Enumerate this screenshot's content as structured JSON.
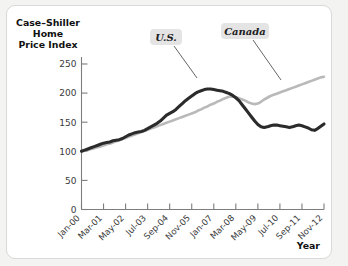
{
  "figure": {
    "y_axis_title_lines": [
      "Case–Shiller",
      "Home",
      "Price Index"
    ],
    "x_axis_title": "Year",
    "series_labels": {
      "us": "U.S.",
      "canada": "Canada"
    },
    "colors": {
      "us_line": "#2b2b2b",
      "canada_line": "#b9b9b9",
      "axis": "#7d7d7d",
      "callout_bg": "#e4e4e4",
      "card_bg": "#ffffff",
      "card_border": "#d9d9d7",
      "page_bg": "#f3f3f1"
    }
  },
  "chart_data": {
    "type": "line",
    "title": "",
    "subtitle": "",
    "xlabel": "Year",
    "ylabel": "Case–Shiller Home Price Index",
    "ylim": [
      0,
      262
    ],
    "yticks": [
      0,
      50,
      100,
      150,
      200,
      250
    ],
    "ytick_labels": [
      "0",
      "50",
      "100",
      "150",
      "200",
      "250"
    ],
    "xtick_labels": [
      "Jan-00",
      "Mar-01",
      "May-02",
      "Jul-03",
      "Sep-04",
      "Nov-05",
      "Jan-07",
      "Mar-08",
      "May-09",
      "Jul-10",
      "Sep-11",
      "Nov-12"
    ],
    "grid": false,
    "legend": "annotated-callouts",
    "annotations": [
      {
        "text": "U.S.",
        "points_to_series": "U.S."
      },
      {
        "text": "Canada",
        "points_to_series": "Canada"
      }
    ],
    "x": [
      0,
      1,
      2,
      3,
      4,
      5,
      6,
      7,
      8,
      9,
      10,
      11,
      12,
      13,
      14,
      15,
      16,
      17,
      18,
      19,
      20,
      21,
      22,
      23,
      24,
      25,
      26,
      27,
      28,
      29,
      30,
      31,
      32,
      33,
      34,
      35,
      36,
      37,
      38,
      39,
      40,
      41,
      42,
      43,
      44,
      45,
      46,
      47,
      48,
      49,
      50,
      51,
      52,
      53,
      54,
      55,
      56,
      57,
      58,
      59,
      60,
      61,
      62,
      63,
      64,
      65,
      66,
      67,
      68,
      69,
      70,
      71,
      72,
      73,
      74,
      75,
      76,
      77
    ],
    "x_dates": [
      "Jan-00",
      "Mar-00",
      "May-00",
      "Jul-00",
      "Sep-00",
      "Nov-00",
      "Jan-01",
      "Mar-01",
      "May-01",
      "Jul-01",
      "Sep-01",
      "Nov-01",
      "Jan-02",
      "Mar-02",
      "May-02",
      "Jul-02",
      "Sep-02",
      "Nov-02",
      "Jan-03",
      "Mar-03",
      "May-03",
      "Jul-03",
      "Sep-03",
      "Nov-03",
      "Jan-04",
      "Mar-04",
      "May-04",
      "Jul-04",
      "Sep-04",
      "Nov-04",
      "Jan-05",
      "Mar-05",
      "May-05",
      "Jul-05",
      "Sep-05",
      "Nov-05",
      "Jan-06",
      "Mar-06",
      "May-06",
      "Jul-06",
      "Sep-06",
      "Nov-06",
      "Jan-07",
      "Mar-07",
      "May-07",
      "Jul-07",
      "Sep-07",
      "Nov-07",
      "Jan-08",
      "Mar-08",
      "May-08",
      "Jul-08",
      "Sep-08",
      "Nov-08",
      "Jan-09",
      "Mar-09",
      "May-09",
      "Jul-09",
      "Sep-09",
      "Nov-09",
      "Jan-10",
      "Mar-10",
      "May-10",
      "Jul-10",
      "Sep-10",
      "Nov-10",
      "Jan-11",
      "Mar-11",
      "May-11",
      "Jul-11",
      "Sep-11",
      "Nov-11",
      "Jan-12",
      "Mar-12",
      "May-12",
      "Jul-12",
      "Sep-12",
      "Nov-12"
    ],
    "series": [
      {
        "name": "U.S.",
        "color": "#2b2b2b",
        "values": [
          100,
          102,
          104,
          106,
          108,
          110,
          112,
          114,
          115,
          116,
          118,
          119,
          120,
          122,
          125,
          128,
          130,
          132,
          133,
          134,
          136,
          139,
          142,
          145,
          148,
          152,
          157,
          162,
          165,
          168,
          172,
          177,
          182,
          187,
          191,
          195,
          199,
          202,
          204,
          206,
          207,
          207,
          206,
          205,
          204,
          203,
          201,
          199,
          196,
          192,
          187,
          180,
          173,
          166,
          159,
          152,
          146,
          142,
          141,
          142,
          144,
          145,
          145,
          144,
          143,
          142,
          141,
          142,
          144,
          145,
          144,
          142,
          140,
          137,
          136,
          139,
          143,
          147
        ]
      },
      {
        "name": "Canada",
        "color": "#b9b9b9",
        "values": [
          100,
          101,
          102,
          104,
          105,
          107,
          108,
          110,
          112,
          113,
          115,
          117,
          119,
          121,
          123,
          125,
          127,
          129,
          131,
          133,
          135,
          137,
          139,
          141,
          143,
          145,
          147,
          149,
          151,
          153,
          155,
          157,
          159,
          161,
          163,
          165,
          167,
          170,
          172,
          175,
          177,
          180,
          182,
          185,
          187,
          190,
          192,
          194,
          194,
          193,
          191,
          189,
          187,
          184,
          182,
          181,
          182,
          185,
          189,
          192,
          195,
          197,
          199,
          201,
          203,
          205,
          207,
          209,
          211,
          213,
          215,
          217,
          219,
          221,
          223,
          225,
          227,
          228
        ]
      }
    ]
  }
}
